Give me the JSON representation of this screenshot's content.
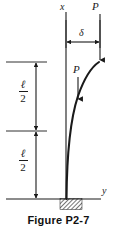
{
  "figure": {
    "caption": "Figure P2-7",
    "labels": {
      "axis_x": "x",
      "axis_y": "y",
      "load_top": "P",
      "load_inner": "P",
      "deflection": "δ",
      "length_upper_num": "ℓ",
      "length_upper_den": "2",
      "length_lower_num": "ℓ",
      "length_lower_den": "2"
    },
    "colors": {
      "ink": "#1a1a1a",
      "background": "#ffffff",
      "caption": "#111111"
    },
    "geometry": {
      "column_base_x": 66,
      "column_base_y": 199,
      "column_top_x": 99,
      "column_top_y": 62,
      "axis_x_line_top": 12,
      "axis_x_line_bottom": 199,
      "ground_line_y": 199,
      "ground_line_left": 6,
      "ground_line_right": 101,
      "delta_arrow_y": 42,
      "delta_arrow_left": 66,
      "delta_arrow_right": 100,
      "dim_line_x": 36,
      "dim_top_y": 62,
      "dim_mid_y": 131,
      "dim_bottom_y": 199,
      "extension_line_left": 6,
      "extension_line_right": 47,
      "support_block_x": 60,
      "support_block_y": 198,
      "support_block_w": 22,
      "support_block_h": 11,
      "inner_load_x": 78,
      "inner_load_top_y": 77,
      "inner_load_bottom_y": 101,
      "top_load_x": 100,
      "top_load_top_y": 14,
      "top_load_bottom_y": 62
    }
  }
}
